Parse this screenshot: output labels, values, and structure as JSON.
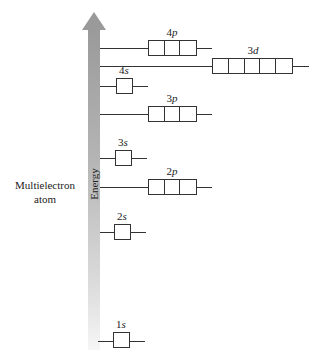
{
  "diagram": {
    "side_label": "Multielectron atom",
    "side_label_lines": [
      "Multielectron",
      "atom"
    ],
    "axis_label": "Energy",
    "axis_color": "#9a9a9a",
    "orbitals": [
      {
        "name": "4p",
        "n": "4",
        "l": "p",
        "boxes": 3
      },
      {
        "name": "3d",
        "n": "3",
        "l": "d",
        "boxes": 5
      },
      {
        "name": "4s",
        "n": "4",
        "l": "s",
        "boxes": 1
      },
      {
        "name": "3p",
        "n": "3",
        "l": "p",
        "boxes": 3
      },
      {
        "name": "3s",
        "n": "3",
        "l": "s",
        "boxes": 1
      },
      {
        "name": "2p",
        "n": "2",
        "l": "p",
        "boxes": 3
      },
      {
        "name": "2s",
        "n": "2",
        "l": "s",
        "boxes": 1
      },
      {
        "name": "1s",
        "n": "1",
        "l": "s",
        "boxes": 1
      }
    ]
  }
}
